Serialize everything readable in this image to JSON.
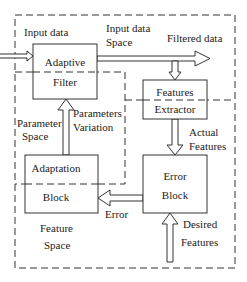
{
  "diagram": {
    "title": "",
    "blocks": {
      "adaptive_filter": {
        "line1": "Adaptive",
        "line2": "Filter"
      },
      "features_extractor": {
        "line1": "Features",
        "line2": "Extractor"
      },
      "adaptation_block": {
        "line1": "Adaptation",
        "line2": "Block"
      },
      "error_block": {
        "line1": "Error",
        "line2": "Block"
      }
    },
    "regions": {
      "input_data_space": {
        "line1": "Input data",
        "line2": "Space"
      },
      "parameter_space": {
        "line1": "Parameter",
        "line2": "Space"
      },
      "feature_space": {
        "line1": "Feature",
        "line2": "Space"
      }
    },
    "signals": {
      "input_data": "Input data",
      "filtered_data": "Filtered data",
      "parameters_variation": {
        "line1": "Parameters",
        "line2": "Variation"
      },
      "actual_features": {
        "line1": "Actual",
        "line2": "Features"
      },
      "error": "Error",
      "desired_features": {
        "line1": "Desired",
        "line2": "Features"
      }
    },
    "colors": {
      "stroke": "#333333",
      "background": "#ffffff",
      "text": "#222222"
    }
  }
}
